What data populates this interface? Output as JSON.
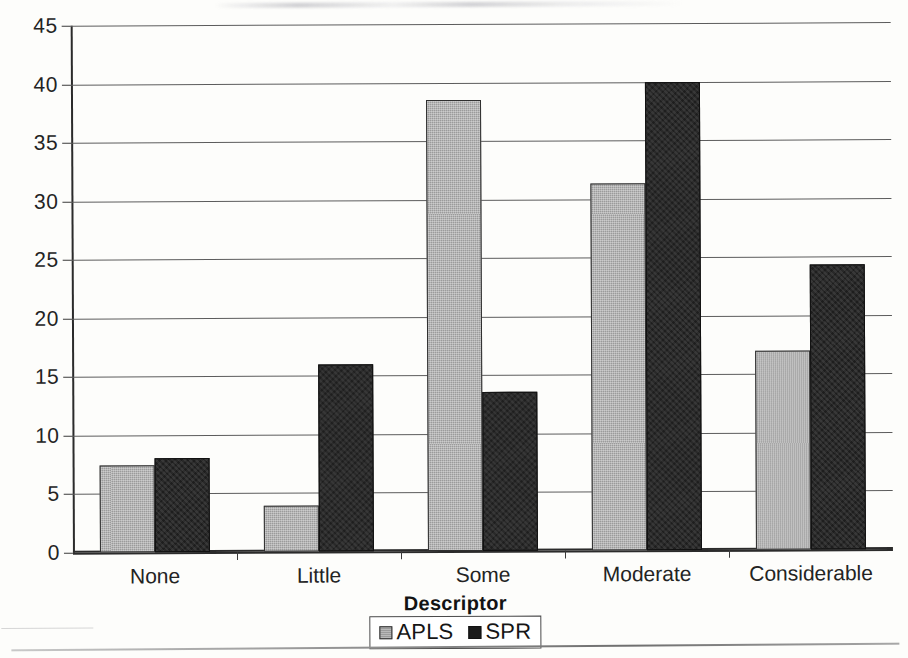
{
  "chart_data": {
    "type": "bar",
    "title": "",
    "xlabel": "Descriptor",
    "ylabel": "",
    "categories": [
      "None",
      "Little",
      "Some",
      "Moderate",
      "Considerable"
    ],
    "series": [
      {
        "name": "APLS",
        "color": "#9b9b9b",
        "values": [
          7.4,
          3.9,
          38.5,
          31.3,
          17.0
        ]
      },
      {
        "name": "SPR",
        "color": "#1e1e1e",
        "values": [
          8.0,
          16.0,
          13.6,
          40.0,
          24.3
        ]
      }
    ],
    "ylim": [
      0,
      45
    ],
    "ytick_step": 5,
    "yticks": [
      "45",
      "40",
      "35",
      "30",
      "25",
      "20",
      "15",
      "10",
      "5",
      "0"
    ],
    "grid": true,
    "legend_position": "bottom"
  },
  "legend": {
    "items": [
      {
        "label": "APLS",
        "swatch": "gray-square-icon"
      },
      {
        "label": "SPR",
        "swatch": "black-square-icon"
      }
    ]
  }
}
